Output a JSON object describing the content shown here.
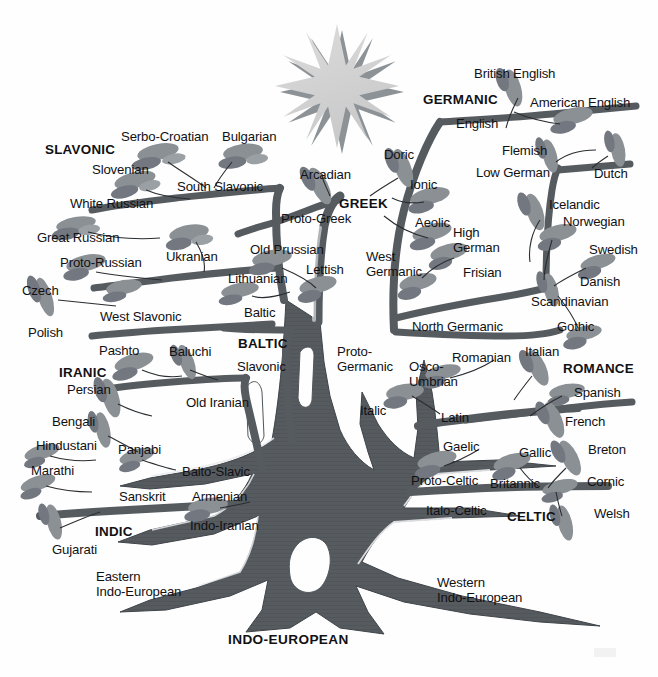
{
  "diagram": {
    "root_label": "INDO-EUROPEAN",
    "colors": {
      "background": "#fefefe",
      "trunk": "#565b60",
      "trunk_dark": "#4a4f54",
      "leaf": "#8b9095",
      "leaf_dark": "#6e7378",
      "sun_fill": "#d3d3d3",
      "sun_shadow": "#8d9297",
      "text": "#111114"
    },
    "sun": {
      "name": "sun-star",
      "points": 16,
      "center_x": 338,
      "center_y": 88,
      "outer_radius": 62,
      "inner_radius": 24
    }
  },
  "families": [
    {
      "id": "slavonic",
      "label": "SLAVONIC",
      "x": 45,
      "y": 142
    },
    {
      "id": "baltic",
      "label": "BALTIC",
      "x": 238,
      "y": 336
    },
    {
      "id": "greek",
      "label": "GREEK",
      "x": 339,
      "y": 196
    },
    {
      "id": "germanic",
      "label": "GERMANIC",
      "x": 423,
      "y": 92
    },
    {
      "id": "romance",
      "label": "ROMANCE",
      "x": 563,
      "y": 361
    },
    {
      "id": "celtic",
      "label": "CELTIC",
      "x": 507,
      "y": 509
    },
    {
      "id": "iranic",
      "label": "IRANIC",
      "x": 59,
      "y": 365
    },
    {
      "id": "indic",
      "label": "INDIC",
      "x": 95,
      "y": 524
    }
  ],
  "branches": {
    "eastern_label": "Eastern\nIndo-European",
    "eastern_x": 96,
    "eastern_y": 570,
    "western_label": "Western\nIndo-European",
    "western_x": 437,
    "western_y": 576
  },
  "nodes": [
    {
      "id": "serbo-croatian",
      "label": "Serbo-Croatian",
      "x": 121,
      "y": 130,
      "group": "slavonic"
    },
    {
      "id": "bulgarian",
      "label": "Bulgarian",
      "x": 222,
      "y": 130,
      "group": "slavonic"
    },
    {
      "id": "slovenian",
      "label": "Slovenian",
      "x": 92,
      "y": 163,
      "group": "slavonic"
    },
    {
      "id": "south-slavonic",
      "label": "South Slavonic",
      "x": 177,
      "y": 180,
      "group": "slavonic"
    },
    {
      "id": "white-russian",
      "label": "White Russian",
      "x": 70,
      "y": 197,
      "group": "slavonic"
    },
    {
      "id": "great-russian",
      "label": "Great Russian",
      "x": 37,
      "y": 231,
      "group": "slavonic"
    },
    {
      "id": "ukranian",
      "label": "Ukranian",
      "x": 166,
      "y": 250,
      "group": "slavonic"
    },
    {
      "id": "proto-russian",
      "label": "Proto-Russian",
      "x": 60,
      "y": 256,
      "group": "slavonic"
    },
    {
      "id": "czech",
      "label": "Czech",
      "x": 22,
      "y": 284,
      "group": "slavonic"
    },
    {
      "id": "west-slavonic",
      "label": "West Slavonic",
      "x": 100,
      "y": 310,
      "group": "slavonic"
    },
    {
      "id": "polish",
      "label": "Polish",
      "x": 28,
      "y": 326,
      "group": "slavonic"
    },
    {
      "id": "slavonic-node",
      "label": "Slavonic",
      "x": 237,
      "y": 360,
      "group": "baltic"
    },
    {
      "id": "old-prussian",
      "label": "Old Prussian",
      "x": 250,
      "y": 243,
      "group": "baltic"
    },
    {
      "id": "lettish",
      "label": "Lettish",
      "x": 306,
      "y": 263,
      "group": "baltic"
    },
    {
      "id": "lithuanian",
      "label": "Lithuanian",
      "x": 228,
      "y": 272,
      "group": "baltic"
    },
    {
      "id": "baltic-node",
      "label": "Baltic",
      "x": 244,
      "y": 306,
      "group": "baltic"
    },
    {
      "id": "balto-slavic",
      "label": "Balto-Slavic",
      "x": 182,
      "y": 465,
      "group": "indo-iranian"
    },
    {
      "id": "armenian",
      "label": "Armenian",
      "x": 192,
      "y": 490,
      "group": "indo-iranian"
    },
    {
      "id": "indo-iranian",
      "label": "Indo-Iranian",
      "x": 190,
      "y": 519,
      "group": "indo-iranian"
    },
    {
      "id": "arcadian",
      "label": "Arcadian",
      "x": 300,
      "y": 168,
      "group": "greek"
    },
    {
      "id": "doric",
      "label": "Doric",
      "x": 384,
      "y": 148,
      "group": "greek"
    },
    {
      "id": "ionic",
      "label": "Ionic",
      "x": 410,
      "y": 178,
      "group": "greek"
    },
    {
      "id": "proto-greek",
      "label": "Proto-Greek",
      "x": 281,
      "y": 212,
      "group": "greek"
    },
    {
      "id": "aeolic",
      "label": "Aeolic",
      "x": 415,
      "y": 216,
      "group": "greek"
    },
    {
      "id": "british-english",
      "label": "British English",
      "x": 474,
      "y": 67,
      "group": "germanic"
    },
    {
      "id": "american-english",
      "label": "American English",
      "x": 530,
      "y": 96,
      "group": "germanic"
    },
    {
      "id": "english",
      "label": "English",
      "x": 456,
      "y": 117,
      "group": "germanic"
    },
    {
      "id": "flemish",
      "label": "Flemish",
      "x": 502,
      "y": 144,
      "group": "germanic"
    },
    {
      "id": "low-german",
      "label": "Low German",
      "x": 476,
      "y": 166,
      "group": "germanic"
    },
    {
      "id": "dutch",
      "label": "Dutch",
      "x": 594,
      "y": 167,
      "group": "germanic"
    },
    {
      "id": "icelandic",
      "label": "Icelandic",
      "x": 549,
      "y": 198,
      "group": "germanic"
    },
    {
      "id": "norwegian",
      "label": "Norwegian",
      "x": 563,
      "y": 215,
      "group": "germanic"
    },
    {
      "id": "high-german",
      "label": "High\nGerman",
      "x": 453,
      "y": 226,
      "group": "germanic"
    },
    {
      "id": "swedish",
      "label": "Swedish",
      "x": 589,
      "y": 243,
      "group": "germanic"
    },
    {
      "id": "frisian",
      "label": "Frisian",
      "x": 463,
      "y": 266,
      "group": "germanic"
    },
    {
      "id": "danish",
      "label": "Danish",
      "x": 580,
      "y": 275,
      "group": "germanic"
    },
    {
      "id": "west-germanic",
      "label": "West\nGermanic",
      "x": 366,
      "y": 250,
      "group": "germanic"
    },
    {
      "id": "scandinavian",
      "label": "Scandinavian",
      "x": 531,
      "y": 295,
      "group": "germanic"
    },
    {
      "id": "gothic",
      "label": "Gothic",
      "x": 557,
      "y": 320,
      "group": "germanic"
    },
    {
      "id": "north-germanic",
      "label": "North Germanic",
      "x": 412,
      "y": 320,
      "group": "germanic"
    },
    {
      "id": "proto-germanic",
      "label": "Proto-\nGermanic",
      "x": 337,
      "y": 345,
      "group": "germanic"
    },
    {
      "id": "romanian",
      "label": "Romanian",
      "x": 452,
      "y": 351,
      "group": "romance"
    },
    {
      "id": "italian",
      "label": "Italian",
      "x": 525,
      "y": 345,
      "group": "romance"
    },
    {
      "id": "osco-umbrian",
      "label": "Osco-\nUmbrian",
      "x": 409,
      "y": 360,
      "group": "romance"
    },
    {
      "id": "spanish",
      "label": "Spanish",
      "x": 574,
      "y": 386,
      "group": "romance"
    },
    {
      "id": "french",
      "label": "French",
      "x": 565,
      "y": 415,
      "group": "romance"
    },
    {
      "id": "italic",
      "label": "Italic",
      "x": 360,
      "y": 404,
      "group": "romance"
    },
    {
      "id": "latin",
      "label": "Latin",
      "x": 441,
      "y": 411,
      "group": "romance"
    },
    {
      "id": "gaelic",
      "label": "Gaelic",
      "x": 443,
      "y": 440,
      "group": "celtic"
    },
    {
      "id": "gallic",
      "label": "Gallic",
      "x": 519,
      "y": 446,
      "group": "celtic"
    },
    {
      "id": "breton",
      "label": "Breton",
      "x": 588,
      "y": 443,
      "group": "celtic"
    },
    {
      "id": "proto-celtic",
      "label": "Proto-Celtic",
      "x": 411,
      "y": 474,
      "group": "celtic"
    },
    {
      "id": "britannic",
      "label": "Britannic",
      "x": 490,
      "y": 477,
      "group": "celtic"
    },
    {
      "id": "cornic",
      "label": "Cornic",
      "x": 587,
      "y": 475,
      "group": "celtic"
    },
    {
      "id": "italo-celtic",
      "label": "Italo-Celtic",
      "x": 426,
      "y": 504,
      "group": "celtic"
    },
    {
      "id": "welsh",
      "label": "Welsh",
      "x": 594,
      "y": 507,
      "group": "celtic"
    },
    {
      "id": "pashto",
      "label": "Pashto",
      "x": 99,
      "y": 344,
      "group": "iranic"
    },
    {
      "id": "baluchi",
      "label": "Baluchi",
      "x": 169,
      "y": 345,
      "group": "iranic"
    },
    {
      "id": "persian",
      "label": "Persian",
      "x": 67,
      "y": 383,
      "group": "iranic"
    },
    {
      "id": "old-iranian",
      "label": "Old Iranian",
      "x": 186,
      "y": 396,
      "group": "iranic"
    },
    {
      "id": "bengali",
      "label": "Bengali",
      "x": 52,
      "y": 415,
      "group": "indic"
    },
    {
      "id": "hindustani",
      "label": "Hindustani",
      "x": 36,
      "y": 439,
      "group": "indic"
    },
    {
      "id": "panjabi",
      "label": "Panjabi",
      "x": 118,
      "y": 443,
      "group": "indic"
    },
    {
      "id": "marathi",
      "label": "Marathi",
      "x": 31,
      "y": 464,
      "group": "indic"
    },
    {
      "id": "sanskrit",
      "label": "Sanskrit",
      "x": 119,
      "y": 490,
      "group": "indic"
    },
    {
      "id": "gujarati",
      "label": "Gujarati",
      "x": 52,
      "y": 543,
      "group": "indic"
    }
  ]
}
